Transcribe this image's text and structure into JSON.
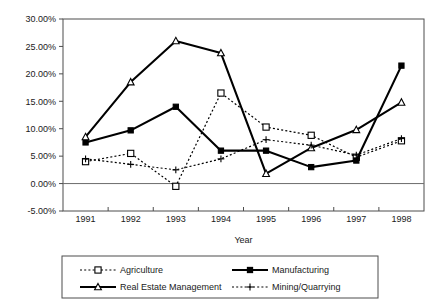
{
  "chart_data": {
    "type": "line",
    "title": "",
    "xlabel": "Year",
    "ylabel": "",
    "categories": [
      "1991",
      "1992",
      "1993",
      "1994",
      "1995",
      "1996",
      "1997",
      "1998"
    ],
    "x": [
      1991,
      1992,
      1993,
      1994,
      1995,
      1996,
      1997,
      1998
    ],
    "ylim": [
      -5.0,
      30.0
    ],
    "ytick_labels": [
      "30.00%",
      "25.00%",
      "20.00%",
      "15.00%",
      "10.00%",
      "5.00%",
      "0.00%",
      "-5.00%"
    ],
    "ytick_values": [
      30.0,
      25.0,
      20.0,
      15.0,
      10.0,
      5.0,
      0.0,
      -5.0
    ],
    "grid": false,
    "legend_position": "bottom",
    "value_suffix": "%",
    "series": [
      {
        "name": "Agriculture",
        "marker": "open-square",
        "line_style": "dotted",
        "values": [
          4.0,
          5.5,
          -0.5,
          16.5,
          10.3,
          8.8,
          4.8,
          7.8
        ]
      },
      {
        "name": "Manufacturing",
        "marker": "filled-square",
        "line_style": "solid",
        "values": [
          7.5,
          9.7,
          14.0,
          6.0,
          6.0,
          3.0,
          4.2,
          21.5
        ]
      },
      {
        "name": "Real Estate Management",
        "marker": "open-triangle",
        "line_style": "solid",
        "values": [
          8.5,
          18.5,
          26.0,
          23.8,
          1.8,
          6.5,
          9.8,
          14.8
        ]
      },
      {
        "name": "Mining/Quarrying",
        "marker": "plus",
        "line_style": "dotted",
        "values": [
          4.5,
          3.5,
          2.5,
          4.5,
          8.0,
          7.0,
          5.2,
          8.2
        ]
      }
    ]
  }
}
